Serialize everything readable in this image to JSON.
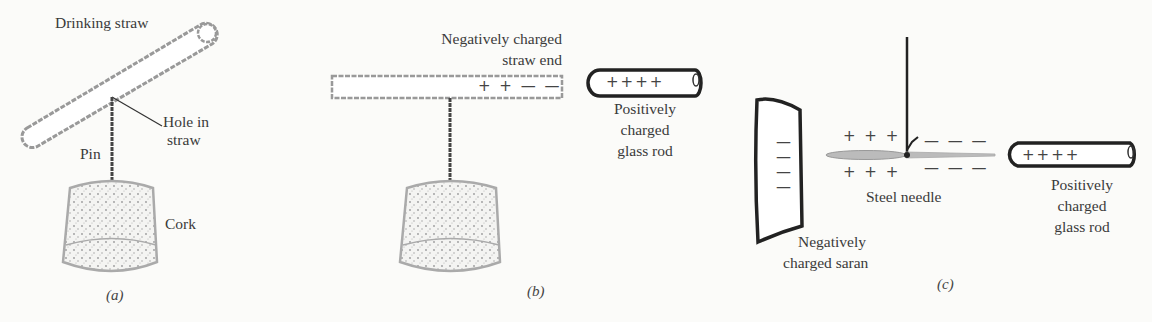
{
  "figure": {
    "panels": [
      {
        "id": "a",
        "caption": "(a)",
        "labels": {
          "straw": "Drinking straw",
          "hole_line1": "Hole in",
          "hole_line2": "straw",
          "pin": "Pin",
          "cork": "Cork"
        }
      },
      {
        "id": "b",
        "caption": "(b)",
        "labels": {
          "straw_end_line1": "Negatively charged",
          "straw_end_line2": "straw end",
          "rod_line1": "Positively",
          "rod_line2": "charged",
          "rod_line3": "glass rod"
        },
        "charges": {
          "straw": "+ + — —",
          "rod": "++++"
        }
      },
      {
        "id": "c",
        "caption": "(c)",
        "labels": {
          "saran_line1": "Negatively",
          "saran_line2": "charged saran",
          "needle": "Steel needle",
          "rod_line1": "Positively",
          "rod_line2": "charged",
          "rod_line3": "glass rod"
        },
        "charges": {
          "saran": [
            "—",
            "—",
            "—",
            "—"
          ],
          "needle_left_top": "+ + +",
          "needle_left_bottom": "+ + +",
          "needle_right_top": "— — —",
          "needle_right_bottom": "— — —",
          "rod": "++++"
        }
      }
    ]
  }
}
